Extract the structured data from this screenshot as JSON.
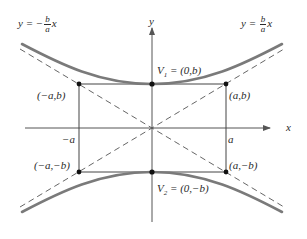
{
  "diagram": {
    "colors": {
      "curve": "#7a7a7a",
      "axes": "#555555",
      "asymptote": "#555555",
      "rectangle": "#444444",
      "point": "#111111",
      "text": "#2a2a2a"
    },
    "axes": {
      "x_label": "x",
      "y_label": "y",
      "tick_neg_a": "−a",
      "tick_a": "a"
    },
    "asymptotes": {
      "left": {
        "prefix": "y = −",
        "num": "b",
        "den": "a",
        "suffix": "x"
      },
      "right": {
        "prefix": "y = ",
        "num": "b",
        "den": "a",
        "suffix": "x"
      }
    },
    "vertices": {
      "v1": {
        "name": "V",
        "sub": "1",
        "value": " = (0,b)"
      },
      "v2": {
        "name": "V",
        "sub": "2",
        "value": " = (0,−b)"
      }
    },
    "corners": {
      "top_left": "(−a,b)",
      "top_right": "(a,b)",
      "bottom_left": "(−a,−b)",
      "bottom_right": "(a,−b)"
    }
  }
}
